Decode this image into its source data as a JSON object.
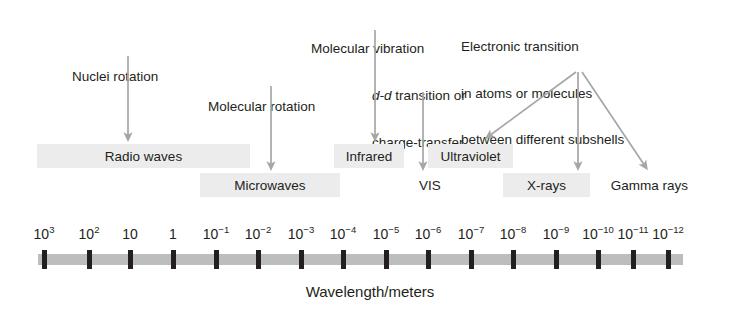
{
  "figure": {
    "type": "diagram",
    "axis_caption": "Wavelength/meters",
    "colors": {
      "band_fill": "#ececec",
      "axis_bar": "#bdbdbd",
      "tick": "#231f20",
      "arrow": "#a6a6a6",
      "text": "#231f20",
      "background": "#ffffff"
    }
  },
  "annotations": [
    {
      "id": "nuclei-rotation",
      "lines": [
        "Nuclei rotation"
      ],
      "x": 72,
      "y": 38,
      "target": "Radio waves"
    },
    {
      "id": "molecular-rotation",
      "lines": [
        "Molecular rotation"
      ],
      "x": 208,
      "y": 68,
      "target": "Microwaves"
    },
    {
      "id": "molecular-vibration",
      "lines": [
        "Molecular vibration"
      ],
      "x": 311,
      "y": 10,
      "target": "Infrared"
    },
    {
      "id": "dd-transition",
      "line1_italic": "d-d",
      "line1_rest": " transition or",
      "line2": "charge-transfer",
      "x": 372,
      "y": 57,
      "target": "VIS"
    },
    {
      "id": "electronic-transition",
      "lines": [
        "Electronic transition",
        "in atoms or molecules",
        "between different subshells"
      ],
      "x": 461,
      "y": 8,
      "targets": [
        "Ultraviolet",
        "X-rays",
        "Gamma rays"
      ]
    }
  ],
  "bands": [
    {
      "id": "radio-waves",
      "label": "Radio waves",
      "row": "upper",
      "highlight": true,
      "x": 37,
      "y": 144,
      "width": 213,
      "height": 24
    },
    {
      "id": "microwaves",
      "label": "Microwaves",
      "row": "lower",
      "highlight": true,
      "x": 200,
      "y": 173,
      "width": 140,
      "height": 24
    },
    {
      "id": "infrared",
      "label": "Infrared",
      "row": "upper",
      "highlight": true,
      "x": 334,
      "y": 144,
      "width": 70,
      "height": 24
    },
    {
      "id": "ultraviolet",
      "label": "Ultraviolet",
      "row": "upper",
      "highlight": true,
      "x": 428,
      "y": 144,
      "width": 85,
      "height": 24
    },
    {
      "id": "vis",
      "label": "VIS",
      "row": "lower",
      "highlight": false,
      "x": 409,
      "y": 173,
      "width": 42,
      "height": 24
    },
    {
      "id": "x-rays",
      "label": "X-rays",
      "row": "lower",
      "highlight": true,
      "x": 503,
      "y": 173,
      "width": 87,
      "height": 24
    },
    {
      "id": "gamma-rays",
      "label": "Gamma rays",
      "row": "lower",
      "highlight": false,
      "x": 598,
      "y": 173,
      "width": 103,
      "height": 24
    }
  ],
  "axis": {
    "bar": {
      "x": 38,
      "y": 254,
      "width": 645,
      "height": 11
    },
    "ticks": [
      {
        "base": "10",
        "exp": "3",
        "x": 44
      },
      {
        "base": "10",
        "exp": "2",
        "x": 89
      },
      {
        "base": "10",
        "exp": "",
        "x": 130
      },
      {
        "base": "1",
        "exp": "",
        "x": 173
      },
      {
        "base": "10",
        "exp": "-1",
        "x": 216
      },
      {
        "base": "10",
        "exp": "-2",
        "x": 258
      },
      {
        "base": "10",
        "exp": "-3",
        "x": 301
      },
      {
        "base": "10",
        "exp": "-4",
        "x": 343
      },
      {
        "base": "10",
        "exp": "-5",
        "x": 386
      },
      {
        "base": "10",
        "exp": "-6",
        "x": 428
      },
      {
        "base": "10",
        "exp": "-7",
        "x": 471
      },
      {
        "base": "10",
        "exp": "-8",
        "x": 513
      },
      {
        "base": "10",
        "exp": "-9",
        "x": 556
      },
      {
        "base": "10",
        "exp": "-10",
        "x": 598
      },
      {
        "base": "10",
        "exp": "-11",
        "x": 633
      },
      {
        "base": "10",
        "exp": "-12",
        "x": 668
      }
    ],
    "caption": "Wavelength/meters",
    "caption_x": 370,
    "caption_y": 283
  }
}
